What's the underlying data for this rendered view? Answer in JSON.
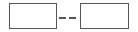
{
  "range_input": {
    "from": {
      "value": "",
      "placeholder": ""
    },
    "separator": "--",
    "to": {
      "value": "",
      "placeholder": ""
    },
    "colors": {
      "border": "#555555",
      "background": "#ffffff"
    }
  }
}
